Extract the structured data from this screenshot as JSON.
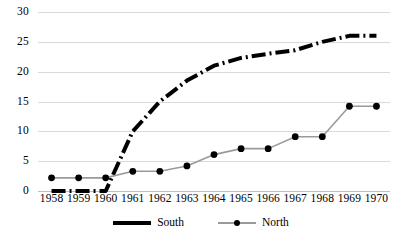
{
  "chart_data": {
    "type": "line",
    "title": "",
    "subtitle": "",
    "xlabel": "",
    "ylabel": "",
    "categories": [
      "1958",
      "1959",
      "1960",
      "1961",
      "1962",
      "1963",
      "1964",
      "1965",
      "1966",
      "1967",
      "1968",
      "1969",
      "1970"
    ],
    "yticks": [
      0,
      5,
      10,
      15,
      20,
      25,
      30
    ],
    "ytick_labels": [
      "0",
      "5",
      "10",
      "15",
      "20",
      "25",
      "30"
    ],
    "ylim": [
      0,
      30
    ],
    "grid": true,
    "legend_position": "bottom",
    "series": [
      {
        "name": "South",
        "color": "#000000",
        "line_style": "dash-dot",
        "line_width": 4,
        "markers": false,
        "values": [
          0,
          0,
          0,
          10,
          15,
          18.5,
          21,
          22.3,
          23,
          23.6,
          25,
          26,
          26
        ]
      },
      {
        "name": "North",
        "color": "#9a9a9a",
        "marker_color": "#000000",
        "line_style": "solid",
        "line_width": 1.6,
        "markers": true,
        "values": [
          2.2,
          2.2,
          2.2,
          3.3,
          3.3,
          4.2,
          6.1,
          7.1,
          7.1,
          9.1,
          9.1,
          14.2,
          14.2
        ]
      }
    ]
  },
  "legend": {
    "entries": [
      {
        "label": "South"
      },
      {
        "label": "North"
      }
    ]
  },
  "colors": {
    "gridline": "#d9d9d9",
    "baseline": "#bfbfbf",
    "south": "#000000",
    "north": "#9a9a9a",
    "marker": "#000000",
    "text": "#000000",
    "background": "#ffffff"
  }
}
